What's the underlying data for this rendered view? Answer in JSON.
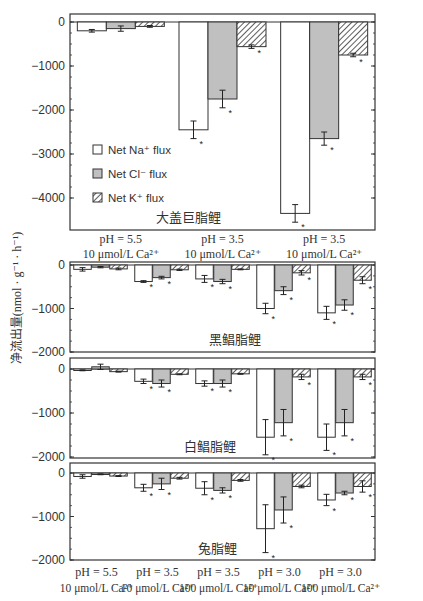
{
  "y_axis_label": "净流出量(nmol · g⁻¹ · h⁻¹)",
  "legend": [
    {
      "label": "Net Na⁺ flux",
      "style": "open"
    },
    {
      "label": "Net Cl⁻ flux",
      "style": "gray"
    },
    {
      "label": "Net K⁺ flux",
      "style": "hatched"
    }
  ],
  "colors": {
    "axis": "#333333",
    "gray_fill": "#c0c0c0",
    "open_fill": "#ffffff",
    "text": "#222222"
  },
  "chart_data": [
    {
      "type": "bar",
      "title": "大盖巨脂鲤",
      "ylabel": "净流出量(nmol · g⁻¹ · h⁻¹)",
      "ylim": [
        -4700,
        200
      ],
      "yticks": [
        0,
        -1000,
        -2000,
        -3000,
        -4000
      ],
      "categories": [
        "pH = 5.5\n10 μmol/L Ca²⁺",
        "pH = 3.5\n10 μmol/L Ca²⁺",
        "pH = 3.5\n10 μmol/L Ca²⁺"
      ],
      "series": [
        {
          "name": "Net Na⁺ flux",
          "values": [
            -200,
            -2450,
            -4350
          ],
          "errors": [
            30,
            200,
            200
          ],
          "significant": [
            false,
            true,
            true
          ]
        },
        {
          "name": "Net Cl⁻ flux",
          "values": [
            -150,
            -1750,
            -2650
          ],
          "errors": [
            60,
            200,
            150
          ],
          "significant": [
            false,
            true,
            true
          ]
        },
        {
          "name": "Net K⁺ flux",
          "values": [
            -100,
            -560,
            -750
          ],
          "errors": [
            20,
            40,
            40
          ],
          "significant": [
            false,
            true,
            true
          ]
        }
      ],
      "legend_position": "left-middle"
    },
    {
      "type": "bar",
      "title": "黑鲳脂鲤",
      "ylim": [
        -2000,
        0
      ],
      "yticks": [
        0,
        -1000,
        -2000
      ],
      "categories": [
        "pH = 5.5 10 μmol/L Ca²⁺",
        "pH = 3.5 10 μmol/L Ca²⁺",
        "pH = 3.5 100 μmol/L Ca²⁺",
        "pH = 3.0 10 μmol/L Ca²⁺",
        "pH = 3.0 100 μmol/L Ca²⁺"
      ],
      "series": [
        {
          "name": "Net Na⁺ flux",
          "values": [
            -100,
            -380,
            -320,
            -1000,
            -1100
          ],
          "errors": [
            40,
            20,
            80,
            120,
            150
          ],
          "significant": [
            false,
            true,
            true,
            true,
            true
          ]
        },
        {
          "name": "Net Cl⁻ flux",
          "values": [
            -50,
            -290,
            -380,
            -590,
            -920
          ],
          "errors": [
            15,
            30,
            50,
            90,
            120
          ],
          "significant": [
            false,
            true,
            true,
            true,
            true
          ]
        },
        {
          "name": "Net K⁺ flux",
          "values": [
            -90,
            -110,
            -100,
            -180,
            -350
          ],
          "errors": [
            20,
            15,
            10,
            50,
            80
          ],
          "significant": [
            false,
            false,
            false,
            true,
            true
          ]
        }
      ]
    },
    {
      "type": "bar",
      "title": "白鲳脂鲤",
      "ylim": [
        -2000,
        100
      ],
      "yticks": [
        0,
        -1000,
        -2000
      ],
      "categories": [
        "pH = 5.5 10 μmol/L Ca²⁺",
        "pH = 3.5 10 μmol/L Ca²⁺",
        "pH = 3.5 100 μmol/L Ca²⁺",
        "pH = 3.0 10 μmol/L Ca²⁺",
        "pH = 3.0 100 μmol/L Ca²⁺"
      ],
      "series": [
        {
          "name": "Net Na⁺ flux",
          "values": [
            -30,
            -280,
            -330,
            -1550,
            -1550
          ],
          "errors": [
            10,
            50,
            60,
            400,
            300
          ],
          "significant": [
            false,
            true,
            true,
            true,
            true
          ]
        },
        {
          "name": "Net Cl⁻ flux",
          "values": [
            50,
            -330,
            -330,
            -1220,
            -1220
          ],
          "errors": [
            60,
            80,
            80,
            300,
            300
          ],
          "significant": [
            false,
            true,
            true,
            true,
            true
          ]
        },
        {
          "name": "Net K⁺ flux",
          "values": [
            -60,
            -120,
            -110,
            -180,
            -180
          ],
          "errors": [
            10,
            10,
            10,
            60,
            60
          ],
          "significant": [
            false,
            false,
            false,
            true,
            true
          ]
        }
      ]
    },
    {
      "type": "bar",
      "title": "兔脂鲤",
      "ylim": [
        -2000,
        100
      ],
      "yticks": [
        0,
        -1000,
        -2000
      ],
      "categories": [
        "pH = 5.5 10 μmol/L Ca²⁺",
        "pH = 3.5 10 μmol/L Ca²⁺",
        "pH = 3.5 100 μmol/L Ca²⁺",
        "pH = 3.0 10 μmol/L Ca²⁺",
        "pH = 3.0 100 μmol/L Ca²⁺"
      ],
      "series": [
        {
          "name": "Net Na⁺ flux",
          "values": [
            -80,
            -340,
            -350,
            -1280,
            -620
          ],
          "errors": [
            40,
            80,
            150,
            550,
            130
          ],
          "significant": [
            false,
            true,
            true,
            true,
            true
          ]
        },
        {
          "name": "Net Cl⁻ flux",
          "values": [
            -30,
            -250,
            -400,
            -850,
            -460
          ],
          "errors": [
            10,
            130,
            60,
            300,
            40
          ],
          "significant": [
            false,
            true,
            true,
            true,
            true
          ]
        },
        {
          "name": "Net K⁺ flux",
          "values": [
            -70,
            -120,
            -170,
            -310,
            -310
          ],
          "errors": [
            10,
            20,
            20,
            30,
            130
          ],
          "significant": [
            false,
            false,
            false,
            false,
            true
          ]
        }
      ]
    }
  ],
  "bottom_labels": [
    {
      "line1": "pH = 5.5",
      "line2": "10 μmol/L Ca²⁺"
    },
    {
      "line1": "pH = 3.5",
      "line2": "10 μmol/L Ca²⁺"
    },
    {
      "line1": "pH = 3.5",
      "line2": "100 μmol/L Ca²⁺"
    },
    {
      "line1": "pH = 3.0",
      "line2": "10 μmol/L Ca²⁺"
    },
    {
      "line1": "pH = 3.0",
      "line2": "100 μmol/L Ca²⁺"
    }
  ],
  "top_panel_labels": [
    {
      "line1": "pH = 5.5",
      "line2": "10 μmol/L Ca²⁺"
    },
    {
      "line1": "pH = 3.5",
      "line2": "10 μmol/L Ca²⁺"
    },
    {
      "line1": "pH = 3.5",
      "line2": "10 μmol/L Ca²⁺"
    }
  ]
}
